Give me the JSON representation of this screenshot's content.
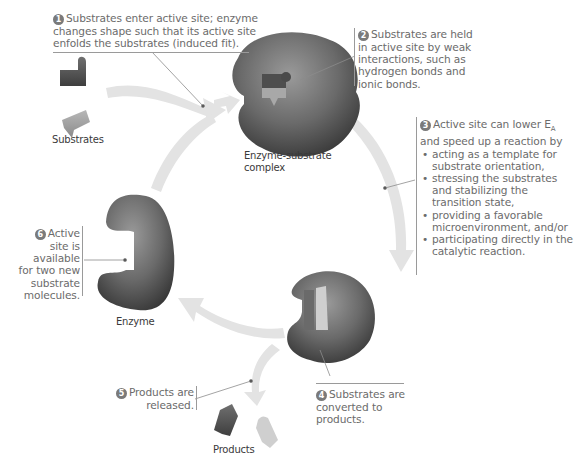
{
  "steps": [
    {
      "number": "1",
      "text": "Substrates enter active site; enzyme changes shape such that its active site enfolds the substrates (induced fit).",
      "lines": [
        "Substrates enter active site; enzyme",
        "changes shape such that its active site",
        "enfolds the substrates (induced fit)."
      ]
    },
    {
      "number": "2",
      "text": "Substrates are held in active site by weak interactions, such as hydrogen bonds and ionic bonds.",
      "lines": [
        "Substrates are held",
        "in active site by weak",
        "interactions, such as",
        "hydrogen bonds and",
        "ionic bonds."
      ]
    },
    {
      "number": "3",
      "intro_lines": [
        "Active site can lower E",
        "and speed up a reaction by"
      ],
      "subscript": "A",
      "bullets": [
        [
          "acting as a template for",
          "substrate orientation,"
        ],
        [
          "stressing the substrates",
          "and stabilizing the",
          "transition state,"
        ],
        [
          "providing a favorable",
          "microenvironment, and/or"
        ],
        [
          "participating directly in the",
          "catalytic reaction."
        ]
      ]
    },
    {
      "number": "4",
      "text": "Substrates are converted to products.",
      "lines": [
        "Substrates are",
        "converted to",
        "products."
      ]
    },
    {
      "number": "5",
      "text": "Products are released.",
      "lines": [
        "Products are",
        "released."
      ]
    },
    {
      "number": "6",
      "text": "Active site is available for two new substrate molecules.",
      "lines": [
        "Active",
        "site is",
        "available",
        "for two new",
        "substrate",
        "molecules."
      ]
    }
  ],
  "labels": {
    "substrates": "Substrates",
    "complex_line1": "Enzyme-substrate",
    "complex_line2": "complex",
    "enzyme": "Enzyme",
    "products": "Products"
  },
  "colors": {
    "enzyme": "#6e6e6e",
    "enzyme_dark": "#3e3e3e",
    "arrow": "#e2e2e2",
    "substrate_dark": "#555555",
    "substrate_light": "#9a9a9a",
    "text": "#6b6b6b"
  }
}
